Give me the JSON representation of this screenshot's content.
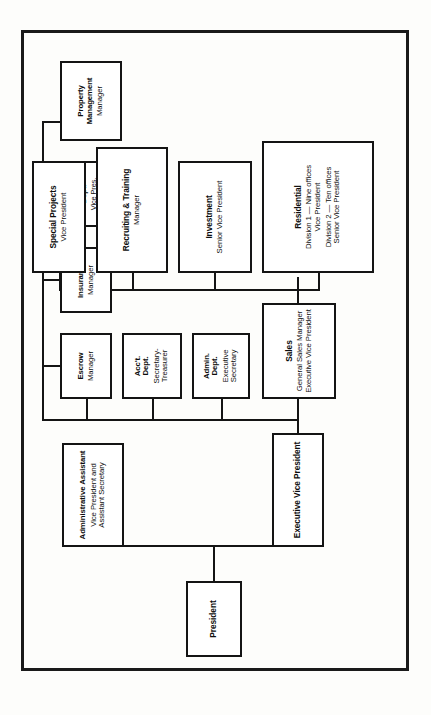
{
  "document": {
    "type": "organization-chart",
    "orientation": "landscape-rotated"
  },
  "nodes": {
    "president": {
      "title": "President",
      "subtitles": []
    },
    "administrative_assistant": {
      "title": "Administrative Assistant",
      "subtitles": [
        "Vice President and",
        "Assistant Secretary"
      ]
    },
    "executive_vice_president": {
      "title": "Executive Vice President",
      "subtitles": []
    },
    "sales": {
      "title": "Sales",
      "subtitles": [
        "General Sales Manager",
        "Executive Vice President"
      ]
    },
    "admin_dept": {
      "title_line1": "Admin.",
      "title_line2": "Dept.",
      "subtitles": [
        "Executive",
        "Secretary"
      ]
    },
    "acct_dept": {
      "title_line1": "Acc't.",
      "title_line2": "Dept.",
      "subtitles": [
        "Secretary-",
        "Treasurer"
      ]
    },
    "escrow": {
      "title": "Escrow",
      "subtitles": [
        "Manager"
      ]
    },
    "insurance": {
      "title": "Insurance",
      "subtitles": [
        "Manager"
      ]
    },
    "loan_dept": {
      "title_line1": "Loan",
      "title_line2": "Dept.",
      "subtitles": [
        "Vice Pres.",
        "& Ass't. Sec."
      ]
    },
    "property_management": {
      "title_line1": "Property",
      "title_line2": "Management",
      "subtitles": [
        "Manager"
      ]
    },
    "residential": {
      "title": "Residential",
      "subtitles": [
        "Division 1 — Nine offices",
        "Vice President",
        "Division 2 — Ten offices",
        "Senior Vice President"
      ]
    },
    "investment": {
      "title": "Investment",
      "subtitles": [
        "Senior Vice President"
      ]
    },
    "recruiting_training": {
      "title": "Recruiting & Training",
      "subtitles": [
        "Manager"
      ]
    },
    "special_projects": {
      "title": "Special Projects",
      "subtitles": [
        "Vice President"
      ]
    }
  },
  "colors": {
    "ink": "#141414",
    "paper": "#fdfdfb",
    "box_fill": "#ffffff"
  }
}
